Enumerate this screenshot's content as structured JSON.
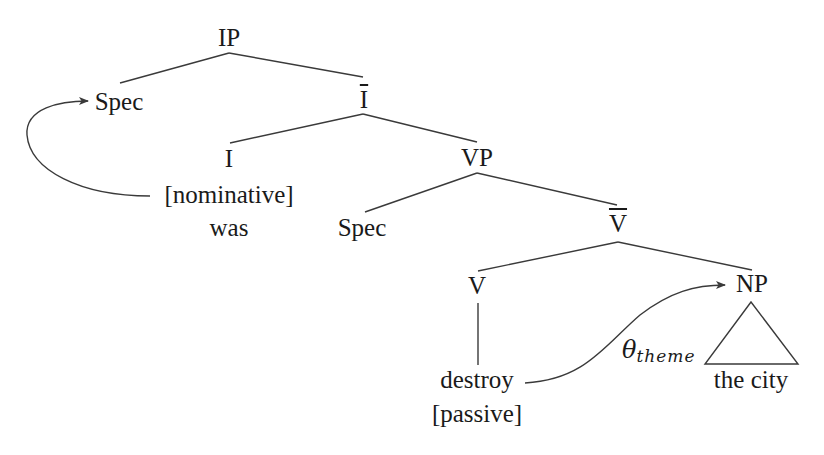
{
  "diagram": {
    "type": "syntax-tree",
    "colors": {
      "line": "#3a3a3a",
      "text": "#1a1a1a",
      "background": "#ffffff"
    },
    "nodes": {
      "ip": {
        "label": "IP"
      },
      "spec_ip": {
        "label": "Spec"
      },
      "i_bar": {
        "label": "I"
      },
      "i": {
        "label": "I"
      },
      "nominative": {
        "label": "[nominative]"
      },
      "was": {
        "label": "was"
      },
      "vp": {
        "label": "VP"
      },
      "spec_vp": {
        "label": "Spec"
      },
      "v_bar": {
        "label": "V"
      },
      "v": {
        "label": "V"
      },
      "destroy": {
        "label": "destroy"
      },
      "passive": {
        "label": "[passive]"
      },
      "np": {
        "label": "NP"
      },
      "the_city": {
        "label": "the city"
      }
    },
    "arrows": {
      "case_movement": {
        "from": "[nominative]",
        "to": "Spec"
      },
      "theta_role": {
        "from": "destroy",
        "to": "NP",
        "label_symbol": "θ",
        "label_subscript": "theme"
      }
    }
  }
}
